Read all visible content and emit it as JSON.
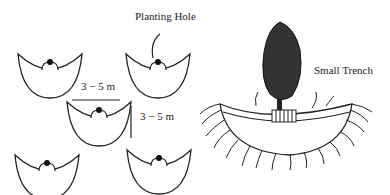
{
  "labels": {
    "planting_hole": "Planting Hole",
    "small_trench": "Small Trench",
    "spacing_horizontal": "3 − 5 m",
    "spacing_vertical": "3 − 5 m"
  },
  "colors": {
    "line": "#222222",
    "tree": "#333333",
    "background": "#ffffff"
  }
}
